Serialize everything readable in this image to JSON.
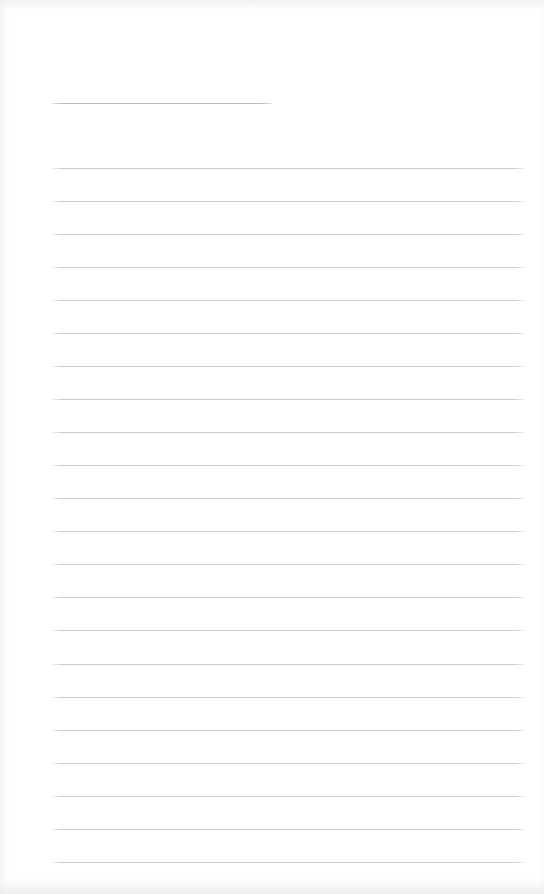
{
  "document": {
    "kind": "scanned-blank-ruled-page",
    "title_line_label": "",
    "body_text": "",
    "page_width": 544,
    "page_height": 894,
    "background_color": "#ffffff",
    "rule_color": "#c9c9cc",
    "header_rule_color": "#bdbdc1"
  },
  "header_rule": {
    "name": "title-rule",
    "x": 52,
    "y": 103,
    "width": 220,
    "value": ""
  },
  "body_rules": {
    "left": 53,
    "right": 524,
    "width": 471,
    "first_y": 168,
    "spacing": 33.05,
    "count": 22,
    "lines": [
      {
        "index": 1,
        "y": 168,
        "value": ""
      },
      {
        "index": 2,
        "y": 201,
        "value": ""
      },
      {
        "index": 3,
        "y": 234,
        "value": ""
      },
      {
        "index": 4,
        "y": 267,
        "value": ""
      },
      {
        "index": 5,
        "y": 300,
        "value": ""
      },
      {
        "index": 6,
        "y": 333,
        "value": ""
      },
      {
        "index": 7,
        "y": 366,
        "value": ""
      },
      {
        "index": 8,
        "y": 399,
        "value": ""
      },
      {
        "index": 9,
        "y": 432,
        "value": ""
      },
      {
        "index": 10,
        "y": 465,
        "value": ""
      },
      {
        "index": 11,
        "y": 498,
        "value": ""
      },
      {
        "index": 12,
        "y": 531,
        "value": ""
      },
      {
        "index": 13,
        "y": 564,
        "value": ""
      },
      {
        "index": 14,
        "y": 597,
        "value": ""
      },
      {
        "index": 15,
        "y": 630,
        "value": ""
      },
      {
        "index": 16,
        "y": 664,
        "value": ""
      },
      {
        "index": 17,
        "y": 697,
        "value": ""
      },
      {
        "index": 18,
        "y": 730,
        "value": ""
      },
      {
        "index": 19,
        "y": 763,
        "value": ""
      },
      {
        "index": 20,
        "y": 796,
        "value": ""
      },
      {
        "index": 21,
        "y": 829,
        "value": ""
      },
      {
        "index": 22,
        "y": 862,
        "value": ""
      }
    ]
  }
}
